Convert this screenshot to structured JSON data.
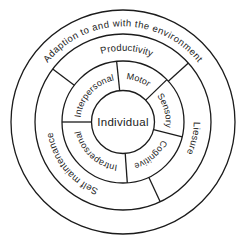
{
  "diagram": {
    "outer_ring": {
      "label": "Adaption to and with the environment"
    },
    "middle_ring": {
      "segments": [
        {
          "label": "Productivity"
        },
        {
          "label": "Liesure"
        },
        {
          "label": "Self maintenance"
        }
      ]
    },
    "inner_ring": {
      "segments": [
        {
          "label": "Interpersonal"
        },
        {
          "label": "Motor"
        },
        {
          "label": "Sensory"
        },
        {
          "label": "Cognitive"
        },
        {
          "label": "Intrapersonal"
        }
      ]
    },
    "center": {
      "label": "Individual"
    },
    "colors": {
      "line": "#1b1b1b",
      "text": "#1b1b1b",
      "background": "#ffffff"
    }
  }
}
